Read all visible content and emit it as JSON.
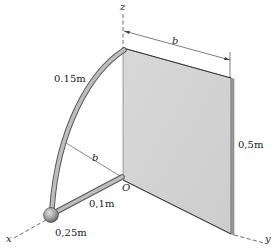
{
  "diagram": {
    "type": "3d-mechanics-figure",
    "axes": {
      "x": "x",
      "y": "y",
      "z": "z",
      "origin": "O"
    },
    "dimensions": {
      "plate_width": "b",
      "plate_height": "0,5m",
      "arc_length_label": "0.15m",
      "arc_radius": "b",
      "rod_length": "0,1m",
      "sphere_label": "0,25m"
    },
    "colors": {
      "plate_fill": "#d4d4d4",
      "plate_edge": "#555555",
      "rod_fill": "#b8b8b8",
      "rod_edge": "#555555",
      "sphere_fill": "#9a9a9a",
      "line": "#444444"
    }
  }
}
